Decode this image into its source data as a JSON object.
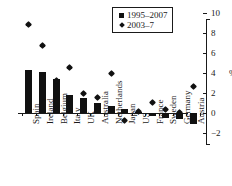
{
  "chart_data": {
    "type": "bar",
    "title": "",
    "subtitle": "",
    "xlabel": "",
    "ylabel": "%",
    "ylim": [
      -2,
      10
    ],
    "yticks": [
      10,
      8,
      6,
      4,
      2,
      0,
      -2
    ],
    "ytick_labels": [
      "10",
      "8",
      "6",
      "4",
      "2",
      "0",
      "−2"
    ],
    "grid": false,
    "axis_position": "right",
    "legend_position": "top-right",
    "categories": [
      "Spain",
      "Ireland",
      "Belgium",
      "Italy",
      "UK",
      "Australia",
      "Netherlands",
      "Japan",
      "US",
      "France",
      "Sweden",
      "Germany",
      "Austria"
    ],
    "series": [
      {
        "name": "1995–2007",
        "marker": "square",
        "render": "bar",
        "color": "#111111",
        "values": [
          4.3,
          4.1,
          3.4,
          1.8,
          1.5,
          1.0,
          0.7,
          0.4,
          0.1,
          -0.3,
          -0.5,
          -0.6,
          -1.1
        ]
      },
      {
        "name": "2003–7",
        "marker": "diamond",
        "render": "point",
        "color": "#111111",
        "values": [
          8.9,
          6.8,
          3.3,
          4.6,
          2.0,
          1.6,
          4.0,
          -0.7,
          0.2,
          1.1,
          0.4,
          0.05,
          2.7
        ]
      }
    ],
    "annotations": []
  },
  "legend": {
    "entries": [
      {
        "label": "1995–2007",
        "marker": "square-marker"
      },
      {
        "label": "2003–7",
        "marker": "diamond-marker"
      }
    ]
  },
  "axis": {
    "unit_label": "%"
  }
}
